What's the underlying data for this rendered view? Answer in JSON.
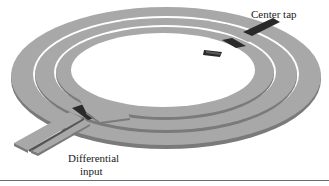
{
  "figure": {
    "type": "3D layout of a symmetric differential (center-tapped) spiral inductor",
    "labels": {
      "center_tap": "Center tap",
      "differential_line1": "Differential",
      "differential_line2": "input"
    },
    "colors": {
      "metal_top": "#a8a8a8",
      "metal_edge": "#7a7a7a",
      "crossover_underpass": "#2a2a2a",
      "background": "#ffffff",
      "rule": "#6a6a6a"
    },
    "turns": 3
  }
}
